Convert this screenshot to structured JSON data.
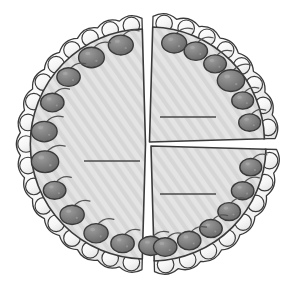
{
  "figure": {
    "name": "cake-divided-into-three-pieces",
    "background_color": "#ffffff",
    "outline_color": "#3a3a3a",
    "cake_fill_color": "#e2e2e2",
    "cake_hatch_color": "#d2d2d2",
    "frosting_fill_color": "#fafafa",
    "frosting_shade_color": "#ececec",
    "cherry_fill_color": "#7a7a7a",
    "cherry_dark_color": "#636363",
    "cherry_highlight_color": "#a8a8a8",
    "stem_color": "#555555",
    "label_line_color": "#4a4a4a",
    "cut_line_color": "#3a3a3a"
  },
  "cake": {
    "center_x": 148,
    "center_y": 144,
    "radius": 128,
    "total_pieces": 3,
    "total_cherries": 23
  },
  "pieces": [
    {
      "id": "left-half",
      "name": "left-half-piece",
      "fraction_label": "",
      "cherry_count": 11,
      "label_line": {
        "x1": 84,
        "y1": 161,
        "x2": 140,
        "y2": 161
      }
    },
    {
      "id": "right-top-quarter",
      "name": "right-top-quarter-piece",
      "fraction_label": "",
      "cherry_count": 6,
      "label_line": {
        "x1": 160,
        "y1": 117,
        "x2": 216,
        "y2": 117
      }
    },
    {
      "id": "right-bottom-quarter",
      "name": "right-bottom-quarter-piece",
      "fraction_label": "",
      "cherry_count": 6,
      "label_line": {
        "x1": 160,
        "y1": 194,
        "x2": 216,
        "y2": 194
      }
    }
  ],
  "cut_lines": [
    {
      "id": "vertical-cut",
      "name": "vertical-cut-line",
      "x1": 148,
      "y1": 16,
      "x2": 148,
      "y2": 272
    },
    {
      "id": "horizontal-cut",
      "name": "horizontal-cut-line",
      "x1": 152,
      "y1": 141,
      "x2": 274,
      "y2": 141
    }
  ],
  "cherries": {
    "left_half": [
      {
        "angle": 104,
        "r": 16.0
      },
      {
        "angle": 122,
        "r": 16.5
      },
      {
        "angle": 139,
        "r": 15.0
      },
      {
        "angle": 156,
        "r": 15.0
      },
      {
        "angle": 173,
        "r": 16.5
      },
      {
        "angle": 190,
        "r": 17.5
      },
      {
        "angle": 207,
        "r": 14.5
      },
      {
        "angle": 224,
        "r": 15.5
      },
      {
        "angle": 241,
        "r": 15.5
      },
      {
        "angle": 257,
        "r": 15.0
      },
      {
        "angle": 273,
        "r": 15.5
      }
    ],
    "right_top_quarter": [
      {
        "angle": 76,
        "r": 16.0
      },
      {
        "angle": 63,
        "r": 15.0
      },
      {
        "angle": 50,
        "r": 14.5
      },
      {
        "angle": 37,
        "r": 17.5
      },
      {
        "angle": 24,
        "r": 14.0
      },
      {
        "angle": 11,
        "r": 14.0
      }
    ],
    "right_bottom_quarter": [
      {
        "angle": -12,
        "r": 14.0
      },
      {
        "angle": -26,
        "r": 14.5
      },
      {
        "angle": -40,
        "r": 14.5
      },
      {
        "angle": -54,
        "r": 14.5
      },
      {
        "angle": -68,
        "r": 15.0
      },
      {
        "angle": -82,
        "r": 15.0
      }
    ]
  }
}
